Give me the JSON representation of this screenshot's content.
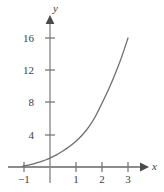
{
  "chart_data": {
    "type": "line",
    "title": "",
    "xlabel": "x",
    "ylabel": "y",
    "xlim": [
      -1.35,
      3.95
    ],
    "ylim": [
      -1.6,
      18.6
    ],
    "grid": false,
    "legend": null,
    "x_ticks": [
      -1,
      1,
      2,
      3
    ],
    "x_tick_labels": [
      "−1",
      "1",
      "2",
      "3"
    ],
    "y_ticks": [
      4,
      8,
      12,
      16
    ],
    "y_tick_labels": [
      "4",
      "8",
      "12",
      "16"
    ],
    "series": [
      {
        "name": "curve",
        "color": "#6e6e6e",
        "x": [
          -1.05,
          -0.9,
          -0.75,
          -0.6,
          -0.45,
          -0.3,
          -0.15,
          0,
          0.25,
          0.5,
          0.75,
          1,
          1.25,
          1.5,
          1.75,
          2,
          2.25,
          2.5,
          2.75,
          3
        ],
        "values": [
          0.12,
          0.2,
          0.3,
          0.42,
          0.56,
          0.72,
          0.9,
          1.1,
          1.5,
          2.0,
          2.55,
          3.2,
          4.0,
          5.0,
          6.3,
          7.9,
          9.6,
          11.5,
          13.6,
          16.0
        ]
      }
    ],
    "axis_color": "#8c8c8c",
    "tick_color": "#6e6e6e",
    "label_color": "#404040"
  },
  "axes": {
    "x_axis_name": "x",
    "y_axis_name": "y"
  }
}
